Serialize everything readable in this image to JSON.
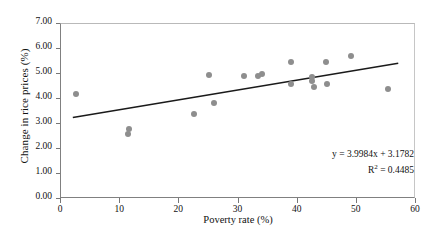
{
  "chart_data": {
    "type": "scatter",
    "title": "",
    "xlabel": "Poverty rate (%)",
    "ylabel": "Change in rice prices (%)",
    "xlim": [
      0,
      60
    ],
    "ylim": [
      0,
      7
    ],
    "xticks": [
      "0",
      "10",
      "20",
      "30",
      "40",
      "50",
      "60"
    ],
    "xtick_values": [
      0,
      10,
      20,
      30,
      40,
      50,
      60
    ],
    "yticks": [
      "0.00",
      "1.00",
      "2.00",
      "3.00",
      "4.00",
      "5.00",
      "6.00",
      "7.00"
    ],
    "ytick_values": [
      0,
      1,
      2,
      3,
      4,
      5,
      6,
      7
    ],
    "grid": false,
    "legend": false,
    "marker_color": "#8e8e8e",
    "trendline_color": "#1a1a1a",
    "points": [
      {
        "x": 2.5,
        "y": 4.22
      },
      {
        "x": 11.3,
        "y": 2.62
      },
      {
        "x": 11.5,
        "y": 2.82
      },
      {
        "x": 22.4,
        "y": 3.42
      },
      {
        "x": 25.0,
        "y": 4.97
      },
      {
        "x": 25.8,
        "y": 3.86
      },
      {
        "x": 30.9,
        "y": 4.93
      },
      {
        "x": 33.3,
        "y": 4.92
      },
      {
        "x": 34.0,
        "y": 5.0
      },
      {
        "x": 38.8,
        "y": 5.5
      },
      {
        "x": 38.9,
        "y": 4.62
      },
      {
        "x": 42.4,
        "y": 4.87
      },
      {
        "x": 42.5,
        "y": 4.74
      },
      {
        "x": 42.8,
        "y": 4.5
      },
      {
        "x": 44.8,
        "y": 5.5
      },
      {
        "x": 44.9,
        "y": 4.62
      },
      {
        "x": 49.0,
        "y": 5.72
      },
      {
        "x": 55.3,
        "y": 4.42
      }
    ],
    "trendline": {
      "equation": "y = 3.9984x + 3.1782",
      "r_squared_label": "R",
      "r_squared_sup": "2",
      "r_squared_value": " = 0.4485",
      "slope": 3.9984,
      "intercept": 3.1782,
      "r2": 0.4485,
      "x_start": 2.0,
      "x_end": 57.0,
      "y_start": 3.26,
      "y_end": 5.43
    }
  },
  "annotations": {
    "equation_line": "y = 3.9984x + 3.1782",
    "r2_prefix": "R",
    "r2_sup": "2",
    "r2_rest": " = 0.4485"
  }
}
